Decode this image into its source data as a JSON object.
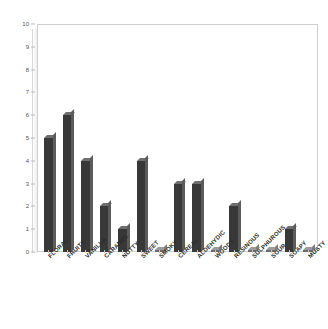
{
  "chart_data": {
    "type": "bar",
    "title": "",
    "subtitle": "",
    "xlabel": "",
    "ylabel": "",
    "ylim": [
      0,
      10
    ],
    "ytick_step": 1,
    "yticks": [
      "10",
      "9",
      "8",
      "7",
      "6",
      "5",
      "4",
      "3",
      "2",
      "1",
      "0"
    ],
    "grid": false,
    "legend": false,
    "legend_position": "none",
    "bar_color": "#383838",
    "background_color": "#ffffff",
    "frame_color": "#cfcfcf",
    "categories": [
      "FLORAL",
      "FRUITY",
      "VANILLA",
      "CARAMEL",
      "NUTTY",
      "SWEET",
      "SMOKY",
      "CEREAL",
      "ALDEHYDIC",
      "WOODY",
      "RESINOUS",
      "SULPHUROUS",
      "SOUR",
      "SOAPY",
      "MUSTY"
    ],
    "values": [
      5,
      6,
      4,
      2,
      1,
      4,
      0,
      3,
      3,
      0,
      2,
      0,
      0,
      1,
      0
    ]
  }
}
